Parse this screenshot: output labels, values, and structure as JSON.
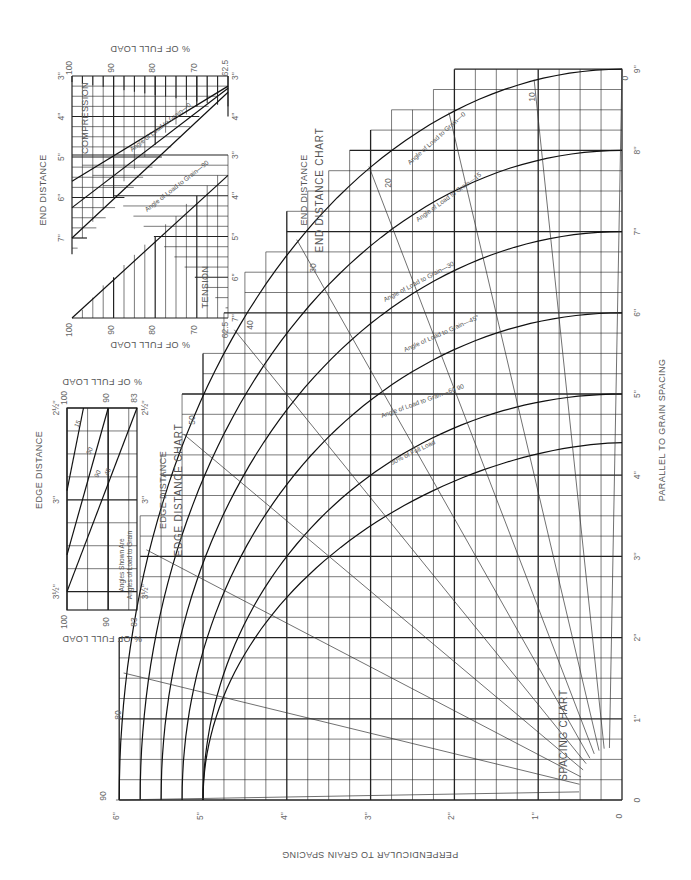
{
  "chart_data": [
    {
      "id": "spacing",
      "type": "line",
      "title": "SPACING CHART",
      "orientation_note": "page rotated 90deg counter-clockwise",
      "xlabel": "PERPENDICULAR TO GRAIN SPACING",
      "ylabel": "PARALLEL TO GRAIN SPACING",
      "x_ticks": [
        "0",
        "1''",
        "2''",
        "3''",
        "4''",
        "5''",
        "6''"
      ],
      "y_ticks": [
        "0",
        "1''",
        "2''",
        "3''",
        "4''",
        "5''",
        "6''",
        "7''",
        "8''",
        "9''"
      ],
      "xlim": [
        0,
        6
      ],
      "ylim": [
        0,
        9
      ],
      "grid": "1/4 inch, bold at whole inches",
      "curves": [
        {
          "name": "Angle of Load to Grain—0",
          "x0": 6,
          "y_end": 9
        },
        {
          "name": "Angle of Load to Grain—15",
          "x0": 5.75,
          "y_end": 8
        },
        {
          "name": "Angle of Load to Grain—30",
          "x0": 5.5,
          "y_end": 7
        },
        {
          "name": "Angle of Load to Grain—45",
          "x0": 5.25,
          "y_end": 6
        },
        {
          "name": "Angle of Load to Grain—60 90",
          "x0": 5,
          "y_end": 5
        },
        {
          "name": "50% of Full Load",
          "x0": 5,
          "y_end": 5
        }
      ],
      "angle_rays": [
        "0",
        "10",
        "20",
        "30",
        "40",
        "50",
        "60",
        "70",
        "80",
        "90"
      ],
      "ray_labels_visible": [
        "0",
        "10",
        "20",
        "30",
        "40",
        "50",
        "80",
        "90"
      ]
    },
    {
      "id": "end-distance",
      "type": "line",
      "title": "END DISTANCE CHART",
      "xlabel": "END DISTANCE",
      "ylabel": "% OF FULL LOAD",
      "panels": [
        {
          "name": "COMPRESSION",
          "x_ticks": [
            "3''",
            "4''",
            "5''",
            "6''",
            "7''"
          ],
          "y_ticks": [
            "100",
            "90",
            "80",
            "70",
            "62.5"
          ],
          "series": [
            {
              "name": "Angle of Load to Grain—0",
              "points": [
                [
                  3.25,
                  62.5
                ],
                [
                  5.6,
                  100
                ]
              ]
            },
            {
              "name": "Angle of Load to Grain—90",
              "points": [
                [
                  3.35,
                  62.5
                ],
                [
                  7.0,
                  100
                ]
              ]
            },
            {
              "name": "middle",
              "points": [
                [
                  3.3,
                  62.5
                ],
                [
                  6.25,
                  100
                ]
              ]
            }
          ]
        },
        {
          "name": "TENSION",
          "x_ticks": [
            "3''",
            "4''",
            "5''",
            "6''",
            "7''"
          ],
          "y_ticks": [
            "100",
            "90",
            "80",
            "70",
            "62.5"
          ],
          "series": [
            {
              "name": "tension",
              "points": [
                [
                  3.5,
                  62.5
                ],
                [
                  7.0,
                  100
                ]
              ]
            }
          ]
        }
      ]
    },
    {
      "id": "edge-distance",
      "type": "line",
      "title": "EDGE DISTANCE CHART",
      "xlabel": "EDGE DISTANCE",
      "ylabel": "% OF FULL LOAD",
      "x_ticks": [
        "2½''",
        "3''",
        "3½''"
      ],
      "y_ticks": [
        "100",
        "90",
        "83"
      ],
      "note": "Angles Shown Are Angles of Load to Grain",
      "series": [
        {
          "name": "15",
          "points": [
            [
              2.5,
              96
            ],
            [
              3.0,
              100
            ]
          ]
        },
        {
          "name": "30",
          "points": [
            [
              2.5,
              90.5
            ],
            [
              3.25,
              100
            ]
          ]
        },
        {
          "name": "45 90",
          "points": [
            [
              2.5,
              83
            ],
            [
              3.5,
              100
            ]
          ]
        }
      ]
    }
  ],
  "labels": {
    "spacing_title": "SPACING CHART",
    "end_title": "END DISTANCE CHART",
    "end_axis": "END DISTANCE",
    "end_axis_top": "END DISTANCE",
    "edge_title": "EDGE DISTANCE CHART",
    "edge_axis": "EDGE DISTANCE",
    "edge_axis_top": "EDGE DISTANCE",
    "pct_full_load": "% OF FULL LOAD",
    "perp": "PERPENDICULAR TO GRAIN SPACING",
    "par": "PARALLEL TO GRAIN SPACING",
    "compression": "COMPRESSION",
    "tension": "TENSION",
    "edge_note_1": "Angles Shown Are",
    "edge_note_2": "Angles of Load to Grain",
    "curve_0": "Angle of Load to Grain—0",
    "curve_15": "Angle of Load to Grain—15",
    "curve_30": "Angle of Load to Grain—30",
    "curve_45": "Angle of Load to Grain—45°",
    "curve_60": "Angle of Load to Grain—60  90",
    "curve_50": "50% of Full Load",
    "end_c0": "Angle of Load to Grain—0",
    "end_c90": "Angle of Load to Grain—90"
  }
}
